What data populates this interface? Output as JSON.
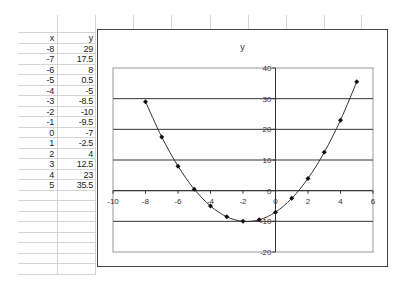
{
  "sheet": {
    "headers": {
      "x": "x",
      "y": "y"
    },
    "rows": [
      {
        "x": "-8",
        "y": "29"
      },
      {
        "x": "-7",
        "y": "17.5"
      },
      {
        "x": "-6",
        "y": "8"
      },
      {
        "x": "-5",
        "y": "0.5"
      },
      {
        "x": "-4",
        "y": "-5"
      },
      {
        "x": "-3",
        "y": "-8.5"
      },
      {
        "x": "-2",
        "y": "-10"
      },
      {
        "x": "-1",
        "y": "-9.5"
      },
      {
        "x": "0",
        "y": "-7"
      },
      {
        "x": "1",
        "y": "-2.5"
      },
      {
        "x": "2",
        "y": "4"
      },
      {
        "x": "3",
        "y": "12.5"
      },
      {
        "x": "4",
        "y": "23"
      },
      {
        "x": "5",
        "y": "35.5"
      }
    ]
  },
  "chart_data": {
    "type": "scatter",
    "title": "y",
    "xlabel": "",
    "ylabel": "",
    "x": [
      -8,
      -7,
      -6,
      -5,
      -4,
      -3,
      -2,
      -1,
      0,
      1,
      2,
      3,
      4,
      5
    ],
    "series": [
      {
        "name": "y",
        "values": [
          29,
          17.5,
          8,
          0.5,
          -5,
          -8.5,
          -10,
          -9.5,
          -7,
          -2.5,
          4,
          12.5,
          23,
          35.5
        ],
        "smooth_line": true,
        "marker": "diamond"
      }
    ],
    "xlim": [
      -10,
      6
    ],
    "ylim": [
      -20,
      40
    ],
    "x_ticks": [
      "-10",
      "-8",
      "-6",
      "-4",
      "-2",
      "0",
      "2",
      "4",
      "6"
    ],
    "y_ticks": [
      "-20",
      "-10",
      "0",
      "10",
      "20",
      "30",
      "40"
    ],
    "grid": {
      "horizontal": true,
      "vertical": false
    },
    "legend": "none",
    "colors": {
      "line": "#333333",
      "marker": "#111111",
      "gridline": "#333333",
      "plot_border": "#999999"
    }
  }
}
